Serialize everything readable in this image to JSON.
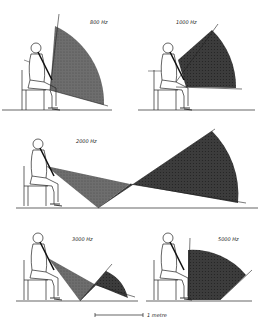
{
  "figure": {
    "panels": [
      {
        "id": "p800",
        "label": "800 Hz"
      },
      {
        "id": "p1000",
        "label": "1000 Hz"
      },
      {
        "id": "p2000",
        "label": "2000 Hz"
      },
      {
        "id": "p3000",
        "label": "3000 Hz"
      },
      {
        "id": "p5000",
        "label": "5000 Hz"
      }
    ],
    "scale_bar": {
      "label": "1 metre"
    },
    "colors": {
      "ink": "#1a1a1a",
      "fill_light": "#7a7a7a",
      "fill_dark": "#3a3a3a",
      "background": "#ffffff"
    }
  }
}
